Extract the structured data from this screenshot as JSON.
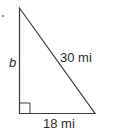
{
  "diagram": {
    "type": "right-triangle",
    "labels": {
      "vertical_leg": "b",
      "hypotenuse": "30 mi",
      "horizontal_leg": "18 mi"
    },
    "right_angle_marker": true,
    "colors": {
      "stroke": "#3a3a3a",
      "text": "#2a2a2a"
    }
  }
}
